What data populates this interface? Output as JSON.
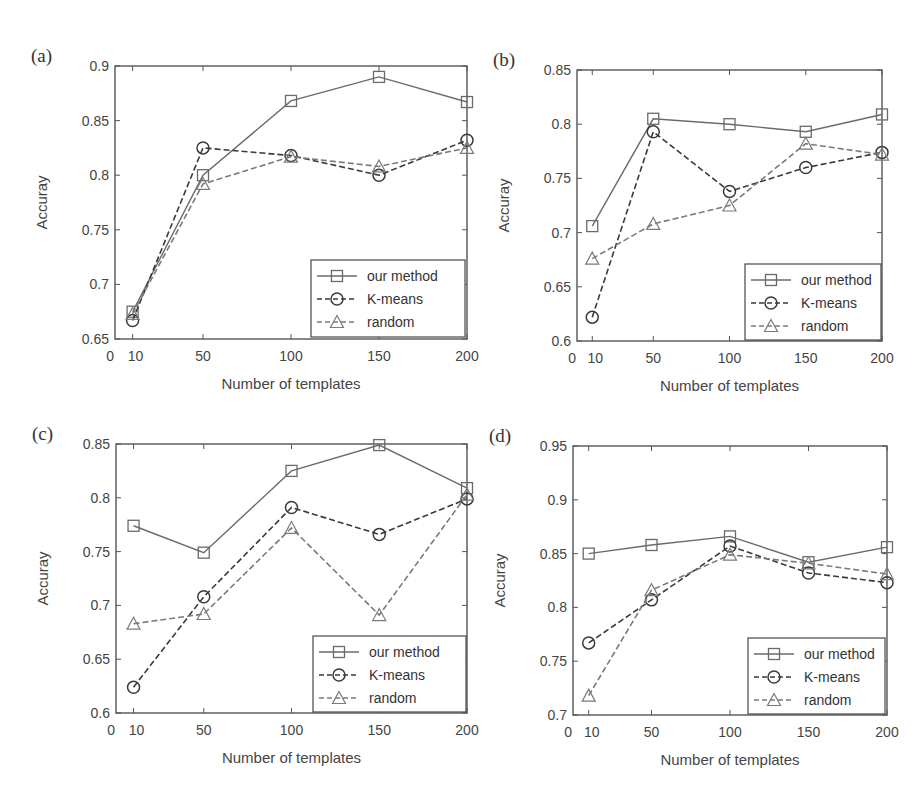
{
  "chart_data": [
    {
      "type": "line",
      "panel_label": "(a)",
      "title": "",
      "xlabel": "Number of templates",
      "ylabel": "Accuray",
      "x": [
        10,
        50,
        100,
        150,
        200
      ],
      "x_ticks": [
        "0",
        "10",
        "50",
        "100",
        "150",
        "200"
      ],
      "y_ticks": [
        "0.65",
        "0.7",
        "0.75",
        "0.8",
        "0.85",
        "0.9"
      ],
      "ylim": [
        0.65,
        0.9
      ],
      "xlim": [
        0,
        200
      ],
      "grid": false,
      "legend_position": "lower right",
      "series": [
        {
          "name": "our method",
          "marker": "square",
          "line": "solid",
          "values": [
            0.675,
            0.8,
            0.868,
            0.89,
            0.867
          ]
        },
        {
          "name": "K-means",
          "marker": "circle",
          "line": "dashed",
          "values": [
            0.667,
            0.825,
            0.818,
            0.8,
            0.832
          ]
        },
        {
          "name": "random",
          "marker": "triangle",
          "line": "dashed",
          "values": [
            0.673,
            0.792,
            0.817,
            0.808,
            0.825
          ]
        }
      ]
    },
    {
      "type": "line",
      "panel_label": "(b)",
      "title": "",
      "xlabel": "Number of templates",
      "ylabel": "Accuray",
      "x": [
        10,
        50,
        100,
        150,
        200
      ],
      "x_ticks": [
        "0",
        "10",
        "50",
        "100",
        "150",
        "200"
      ],
      "y_ticks": [
        "0.6",
        "0.65",
        "0.7",
        "0.75",
        "0.8",
        "0.85"
      ],
      "ylim": [
        0.6,
        0.85
      ],
      "xlim": [
        0,
        200
      ],
      "grid": false,
      "legend_position": "lower right",
      "series": [
        {
          "name": "our method",
          "marker": "square",
          "line": "solid",
          "values": [
            0.706,
            0.805,
            0.8,
            0.793,
            0.809
          ]
        },
        {
          "name": "K-means",
          "marker": "circle",
          "line": "dashed",
          "values": [
            0.622,
            0.793,
            0.738,
            0.76,
            0.774
          ]
        },
        {
          "name": "random",
          "marker": "triangle",
          "line": "dashed",
          "values": [
            0.676,
            0.708,
            0.725,
            0.782,
            0.772
          ]
        }
      ]
    },
    {
      "type": "line",
      "panel_label": "(c)",
      "title": "",
      "xlabel": "Number of templates",
      "ylabel": "Accuray",
      "x": [
        10,
        50,
        100,
        150,
        200
      ],
      "x_ticks": [
        "0",
        "10",
        "50",
        "100",
        "150",
        "200"
      ],
      "y_ticks": [
        "0.6",
        "0.65",
        "0.7",
        "0.75",
        "0.8",
        "0.85"
      ],
      "ylim": [
        0.6,
        0.85
      ],
      "xlim": [
        0,
        200
      ],
      "grid": false,
      "legend_position": "lower right",
      "series": [
        {
          "name": "our method",
          "marker": "square",
          "line": "solid",
          "values": [
            0.774,
            0.749,
            0.825,
            0.849,
            0.809
          ]
        },
        {
          "name": "K-means",
          "marker": "circle",
          "line": "dashed",
          "values": [
            0.624,
            0.708,
            0.791,
            0.766,
            0.799
          ]
        },
        {
          "name": "random",
          "marker": "triangle",
          "line": "dashed",
          "values": [
            0.683,
            0.692,
            0.772,
            0.691,
            0.803
          ]
        }
      ]
    },
    {
      "type": "line",
      "panel_label": "(d)",
      "title": "",
      "xlabel": "Number of templates",
      "ylabel": "Accuray",
      "x": [
        10,
        50,
        100,
        150,
        200
      ],
      "x_ticks": [
        "0",
        "10",
        "50",
        "100",
        "150",
        "200"
      ],
      "y_ticks": [
        "0.7",
        "0.75",
        "0.8",
        "0.85",
        "0.9",
        "0.95"
      ],
      "ylim": [
        0.7,
        0.95
      ],
      "xlim": [
        0,
        200
      ],
      "grid": false,
      "legend_position": "lower right",
      "series": [
        {
          "name": "our method",
          "marker": "square",
          "line": "solid",
          "values": [
            0.85,
            0.858,
            0.866,
            0.842,
            0.856
          ]
        },
        {
          "name": "K-means",
          "marker": "circle",
          "line": "dashed",
          "values": [
            0.767,
            0.807,
            0.857,
            0.832,
            0.823
          ]
        },
        {
          "name": "random",
          "marker": "triangle",
          "line": "dashed",
          "values": [
            0.718,
            0.816,
            0.849,
            0.841,
            0.831
          ]
        }
      ]
    }
  ],
  "style": {
    "series_colors": {
      "our method": "#6a6a6a",
      "K-means": "#3a3a3a",
      "random": "#7a7a7a"
    },
    "frame_color": "#555555"
  }
}
